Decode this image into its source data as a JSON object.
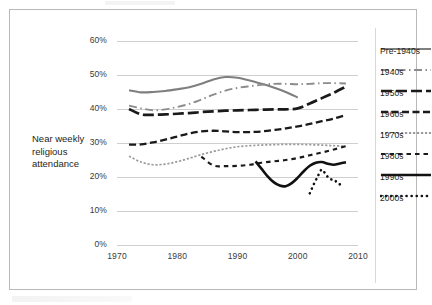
{
  "chart_data": {
    "type": "line",
    "title": "",
    "xlabel": "",
    "ylabel": "Near weekly religious attendance",
    "xlim": [
      1970,
      2010
    ],
    "ylim": [
      0,
      60
    ],
    "grid": true,
    "legend_position": "right",
    "y_ticks": [
      "0%",
      "10%",
      "20%",
      "30%",
      "40%",
      "50%",
      "60%"
    ],
    "y_tick_values": [
      0,
      10,
      20,
      30,
      40,
      50,
      60
    ],
    "x_ticks": [
      "1970",
      "1980",
      "1990",
      "2000",
      "2010"
    ],
    "x_tick_values": [
      1970,
      1980,
      1990,
      2000,
      2010
    ],
    "series": [
      {
        "name": "Pre-1940s",
        "color": "#7f7f7f",
        "style": "solid",
        "width": 2.1,
        "x": [
          1972,
          1974,
          1976,
          1978,
          1980,
          1982,
          1984,
          1986,
          1988,
          1990,
          1992,
          1994,
          1996,
          1998,
          2000
        ],
        "values": [
          45.5,
          44.9,
          45.0,
          45.3,
          45.8,
          46.4,
          47.4,
          48.7,
          49.4,
          49.2,
          48.4,
          47.4,
          46.3,
          45.0,
          43.4
        ]
      },
      {
        "name": "1940s",
        "color": "#8c8c8c",
        "style": "dashdot",
        "width": 1.9,
        "x": [
          1972,
          1974,
          1976,
          1978,
          1980,
          1982,
          1984,
          1986,
          1988,
          1990,
          1992,
          1994,
          1996,
          1998,
          2000,
          2002,
          2004,
          2006,
          2008
        ],
        "values": [
          41.0,
          40.2,
          39.6,
          39.9,
          40.6,
          41.5,
          42.8,
          44.2,
          45.4,
          46.2,
          46.7,
          47.1,
          47.4,
          47.4,
          47.3,
          47.4,
          47.6,
          47.6,
          47.5
        ]
      },
      {
        "name": "1950s",
        "color": "#1a1a1a",
        "style": "longdash",
        "width": 2.7,
        "x": [
          1972,
          1974,
          1976,
          1978,
          1980,
          1982,
          1984,
          1986,
          1988,
          1990,
          1992,
          1994,
          1996,
          1998,
          2000,
          2002,
          2004,
          2006,
          2008
        ],
        "values": [
          40.0,
          38.4,
          38.3,
          38.4,
          38.6,
          38.8,
          39.1,
          39.3,
          39.5,
          39.6,
          39.7,
          39.8,
          39.9,
          39.9,
          40.2,
          41.6,
          43.2,
          44.8,
          46.6
        ]
      },
      {
        "name": "1960s",
        "color": "#1a1a1a",
        "style": "dashed",
        "width": 2.3,
        "x": [
          1972,
          1974,
          1976,
          1978,
          1980,
          1982,
          1984,
          1986,
          1988,
          1990,
          1992,
          1994,
          1996,
          1998,
          2000,
          2002,
          2004,
          2006,
          2008
        ],
        "values": [
          29.5,
          29.6,
          30.2,
          31.0,
          31.9,
          32.8,
          33.4,
          33.6,
          33.4,
          33.2,
          33.2,
          33.4,
          33.8,
          34.3,
          34.9,
          35.6,
          36.4,
          37.2,
          38.2
        ]
      },
      {
        "name": "1970s",
        "color": "#9a9a9a",
        "style": "finedash",
        "width": 1.7,
        "x": [
          1972,
          1974,
          1976,
          1978,
          1980,
          1982,
          1984,
          1986,
          1988,
          1990,
          1992,
          1994,
          1996,
          1998,
          2000,
          2002,
          2004,
          2006,
          2008
        ],
        "values": [
          26.1,
          24.4,
          23.6,
          23.8,
          24.5,
          25.5,
          26.6,
          27.5,
          28.3,
          28.9,
          29.2,
          29.4,
          29.5,
          29.6,
          29.6,
          29.5,
          29.4,
          29.2,
          29.1
        ]
      },
      {
        "name": "1980s",
        "color": "#1a1a1a",
        "style": "shortdash",
        "width": 2.2,
        "x": [
          1984,
          1986,
          1988,
          1990,
          1992,
          1994,
          1996,
          1998,
          2000,
          2002,
          2004,
          2006,
          2008
        ],
        "values": [
          26.0,
          23.4,
          23.2,
          23.3,
          23.6,
          24.2,
          24.6,
          25.0,
          25.6,
          26.4,
          27.2,
          28.1,
          29.1
        ]
      },
      {
        "name": "1990s",
        "color": "#111111",
        "style": "solid",
        "width": 2.6,
        "x": [
          1993,
          1994,
          1995,
          1996,
          1997,
          1998,
          1999,
          2000,
          2001,
          2002,
          2003,
          2004,
          2005,
          2006,
          2007,
          2008
        ],
        "values": [
          24.6,
          22.4,
          20.2,
          18.5,
          17.5,
          17.3,
          18.2,
          19.8,
          21.7,
          23.3,
          24.2,
          24.4,
          23.9,
          23.6,
          24.0,
          24.3
        ]
      },
      {
        "name": "2000s",
        "color": "#111111",
        "style": "dotted",
        "width": 2.6,
        "x": [
          2002,
          2002.7,
          2003.3,
          2004,
          2004.7,
          2005.4,
          2006.1,
          2006.8,
          2007.5
        ],
        "values": [
          15.2,
          18.0,
          20.1,
          22.2,
          20.6,
          19.4,
          19.1,
          17.9,
          18.0
        ]
      }
    ]
  },
  "legend": {
    "items": [
      {
        "label": "Pre-1940s"
      },
      {
        "label": "1940s"
      },
      {
        "label": "1950s"
      },
      {
        "label": "1960s"
      },
      {
        "label": "1970s"
      },
      {
        "label": "1980s"
      },
      {
        "label": "1990s"
      },
      {
        "label": "2000s"
      }
    ]
  }
}
